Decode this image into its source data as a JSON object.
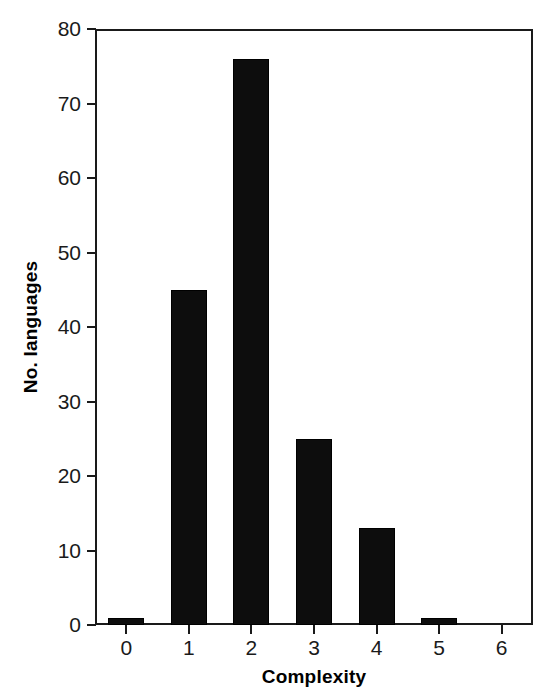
{
  "chart_data": {
    "type": "bar",
    "title": "",
    "xlabel": "Complexity",
    "ylabel": "No. languages",
    "categories": [
      "0",
      "1",
      "2",
      "3",
      "4",
      "5",
      "6"
    ],
    "values": [
      1,
      45,
      76,
      25,
      13,
      1,
      0
    ],
    "xlim": [
      -0.5,
      6.5
    ],
    "ylim": [
      0,
      80
    ],
    "yticks": [
      0,
      10,
      20,
      30,
      40,
      50,
      60,
      70,
      80
    ],
    "ytick_labels": [
      "0",
      "10",
      "20",
      "30",
      "40",
      "50",
      "60",
      "70",
      "80"
    ],
    "xticks": [
      0,
      1,
      2,
      3,
      4,
      5,
      6
    ],
    "xtick_labels": [
      "0",
      "1",
      "2",
      "3",
      "4",
      "5",
      "6"
    ],
    "grid": false,
    "legend": null,
    "legend_position": "none",
    "bar_color": "#0d0d0d",
    "axis_color": "#1a1a1a",
    "background_color": "#ffffff",
    "frame": "box"
  }
}
